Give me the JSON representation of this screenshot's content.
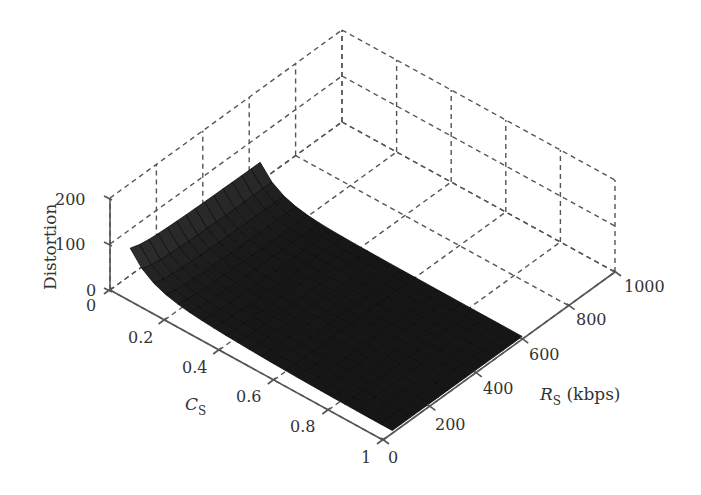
{
  "chart_data": {
    "type": "surface3d",
    "title": "",
    "xlabel": "C_S",
    "ylabel": "R_S (kbps)",
    "zlabel": "Distortion",
    "axis_labels": {
      "x_main": "C",
      "x_sub": "S",
      "y_main": "R",
      "y_sub": "S",
      "y_unit": " (kbps)",
      "z": "Distortion"
    },
    "x_ticks": [
      "0",
      "0.2",
      "0.4",
      "0.6",
      "0.8",
      "1"
    ],
    "y_ticks": [
      "0",
      "200",
      "400",
      "600",
      "800",
      "1000"
    ],
    "z_ticks": [
      "0",
      "100",
      "200"
    ],
    "xlim": [
      0,
      1
    ],
    "ylim": [
      0,
      1000
    ],
    "zlim": [
      0,
      200
    ],
    "grid": true,
    "grid_style": "dashed",
    "surface_color": "#1a1a1a",
    "surface_extent": {
      "Cs": [
        0.05,
        1.0
      ],
      "Rs_kbps": [
        50,
        600
      ]
    },
    "approx_points": [
      {
        "Cs": 0.05,
        "Rs": 50,
        "distortion": 120
      },
      {
        "Cs": 0.05,
        "Rs": 600,
        "distortion": 20
      },
      {
        "Cs": 0.3,
        "Rs": 600,
        "distortion": 200
      },
      {
        "Cs": 1.0,
        "Rs": 50,
        "distortion": 5
      },
      {
        "Cs": 1.0,
        "Rs": 600,
        "distortion": 5
      },
      {
        "Cs": 0.5,
        "Rs": 300,
        "distortion": 30
      }
    ]
  }
}
